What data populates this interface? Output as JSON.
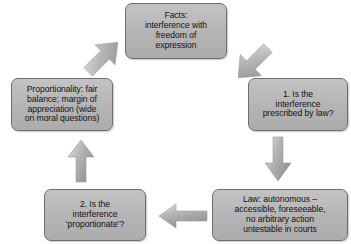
{
  "diagram": {
    "style": {
      "node_fill": "#b8b8b8",
      "node_border": "#6e6e6e",
      "arrow_fill": "#a8a8a8",
      "background": "#ffffff",
      "text_color": "#111111"
    },
    "nodes": [
      {
        "id": "facts",
        "name": "facts-node",
        "text": "Facts: interference with freedom of expression",
        "lines": [
          "Facts:",
          "interference with",
          "freedom of",
          "expression"
        ]
      },
      {
        "id": "step1",
        "name": "step1-node",
        "text": "1. Is the interference prescribed by law?",
        "lines": [
          "1. Is the",
          "interference",
          "prescribed by law?"
        ]
      },
      {
        "id": "law",
        "name": "law-node",
        "text": "Law: autonomous – accessible, foreseeable, no arbitrary action untestable in courts",
        "lines": [
          "Law: autonomous –",
          "accessible, foreseeable,",
          "no arbitrary action",
          "untestable in courts"
        ]
      },
      {
        "id": "step2",
        "name": "step2-node",
        "text": "2. Is the interference ‘proportionate’?",
        "lines": [
          "2. Is the",
          "interference",
          "‘proportionate’?"
        ]
      },
      {
        "id": "proportionality",
        "name": "proportionality-node",
        "text": "Proportionality: fair balance; margin of appreciation (wide on moral questions)",
        "lines": [
          "Proportionality: fair",
          "balance; margin of",
          "appreciation (wide",
          "on moral questions)"
        ]
      }
    ],
    "arrows": [
      {
        "id": "a1",
        "from": "facts",
        "to": "step1",
        "direction": "down-right"
      },
      {
        "id": "a2",
        "from": "step1",
        "to": "law",
        "direction": "down"
      },
      {
        "id": "a3",
        "from": "law",
        "to": "step2",
        "direction": "left"
      },
      {
        "id": "a4",
        "from": "step2",
        "to": "proportionality",
        "direction": "up"
      },
      {
        "id": "a5",
        "from": "proportionality",
        "to": "facts",
        "direction": "up-right"
      }
    ]
  }
}
